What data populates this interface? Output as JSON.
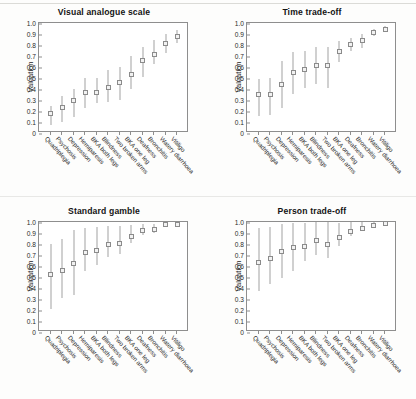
{
  "figure": {
    "y_axis_label": "Valuation",
    "y_ticks": [
      "1.0",
      "0.9",
      "0.8",
      "0.7",
      "0.6",
      "0.5",
      "0.4",
      "0.3",
      "0.2",
      "0.1",
      "0"
    ],
    "marker_color": "#f2f2f2",
    "marker_edge_color": "#8b8b8b",
    "error_bar_color": "#a2a2a2",
    "axis_color": "#8e8e8e"
  },
  "chart_data": [
    {
      "type": "scatter",
      "title": "Visual analogue scale",
      "xlabel": "",
      "ylabel": "Valuation",
      "ylim": [
        0,
        1.0
      ],
      "grid": false,
      "legend": "none",
      "categories": [
        "Quadriplegia",
        "Psychosis",
        "Depression",
        "Hemiparesis",
        "BKA both legs",
        "Blindness",
        "Two broken arms",
        "BKA one leg",
        "Deafness",
        "Bronchitis",
        "Watery diarrhoea",
        "Vitiligo"
      ],
      "values": [
        0.18,
        0.23,
        0.3,
        0.37,
        0.37,
        0.41,
        0.455,
        0.53,
        0.66,
        0.715,
        0.81,
        0.875
      ],
      "error_low": [
        0.07,
        0.1,
        0.15,
        0.23,
        0.27,
        0.28,
        0.3,
        0.4,
        0.51,
        0.63,
        0.73,
        0.82
      ],
      "error_high": [
        0.25,
        0.34,
        0.4,
        0.5,
        0.5,
        0.57,
        0.6,
        0.7,
        0.78,
        0.85,
        0.9,
        0.94
      ]
    },
    {
      "type": "scatter",
      "title": "Time trade-off",
      "xlabel": "",
      "ylabel": "Valuation",
      "ylim": [
        0,
        1.0
      ],
      "grid": false,
      "legend": "none",
      "categories": [
        "Quadriplegia",
        "Psychosis",
        "Depression",
        "Hemiparesis",
        "BKA both legs",
        "Blindness",
        "Two broken arms",
        "BKA one leg",
        "Deafness",
        "Bronchitis",
        "Watery diarrhoea",
        "Vitiligo"
      ],
      "values": [
        0.35,
        0.35,
        0.445,
        0.55,
        0.575,
        0.615,
        0.61,
        0.74,
        0.805,
        0.84,
        0.915,
        0.945
      ],
      "error_low": [
        0.155,
        0.16,
        0.225,
        0.35,
        0.405,
        0.445,
        0.41,
        0.645,
        0.745,
        0.775,
        0.88,
        0.915
      ],
      "error_high": [
        0.49,
        0.5,
        0.655,
        0.74,
        0.745,
        0.78,
        0.78,
        0.84,
        0.865,
        0.9,
        0.945,
        0.975
      ]
    },
    {
      "type": "scatter",
      "title": "Standard gamble",
      "xlabel": "",
      "ylabel": "Valuation",
      "ylim": [
        0,
        1.0
      ],
      "grid": false,
      "legend": "none",
      "categories": [
        "Quadriplegia",
        "Psychosis",
        "Depression",
        "Hemiparesis",
        "BKA both legs",
        "Blindness",
        "Two broken arms",
        "BKA one leg",
        "Deafness",
        "Bronchitis",
        "Watery diarrhoea",
        "Vitiligo"
      ],
      "values": [
        0.52,
        0.56,
        0.62,
        0.725,
        0.745,
        0.795,
        0.805,
        0.865,
        0.92,
        0.935,
        0.98,
        0.98
      ],
      "error_low": [
        0.21,
        0.31,
        0.335,
        0.555,
        0.61,
        0.685,
        0.71,
        0.805,
        0.885,
        0.9,
        0.965,
        0.965
      ],
      "error_high": [
        0.8,
        0.85,
        0.93,
        0.95,
        0.955,
        0.965,
        0.965,
        0.975,
        0.985,
        0.985,
        1.0,
        1.0
      ]
    },
    {
      "type": "scatter",
      "title": "Person trade-off",
      "xlabel": "",
      "ylabel": "Valuation",
      "ylim": [
        0,
        1.0
      ],
      "grid": false,
      "legend": "none",
      "categories": [
        "Quadriplegia",
        "Psychosis",
        "Depression",
        "Hemiparesis",
        "BKA both legs",
        "Blindness",
        "Two broken arms",
        "BKA one leg",
        "Deafness",
        "Bronchitis",
        "Watery diarrhoea",
        "Vitiligo"
      ],
      "values": [
        0.63,
        0.67,
        0.735,
        0.77,
        0.78,
        0.83,
        0.795,
        0.855,
        0.915,
        0.945,
        0.965,
        0.985
      ],
      "error_low": [
        0.375,
        0.44,
        0.495,
        0.555,
        0.645,
        0.7,
        0.67,
        0.785,
        0.875,
        0.92,
        0.945,
        0.975
      ],
      "error_high": [
        0.945,
        0.955,
        0.985,
        0.99,
        0.995,
        1.0,
        1.0,
        0.995,
        1.0,
        1.0,
        1.0,
        1.0
      ]
    }
  ]
}
